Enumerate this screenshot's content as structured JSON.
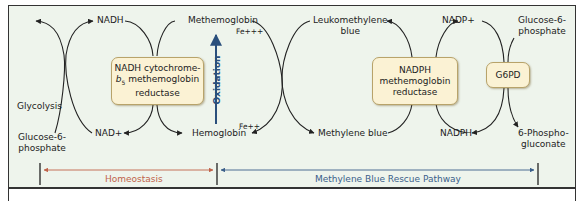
{
  "colors": {
    "background": "#eef4ec",
    "enzyme_fill": "#fbf2d4",
    "enzyme_border": "#b8a36a",
    "curve": "#222222",
    "oxidation": "#2a4f7c",
    "homeostasis": "#c0634a",
    "rescue": "#3b5f8a"
  },
  "left_cycle": {
    "top_left": "Glycolysis",
    "bottom_left": "Glucose-6-\nphosphate",
    "top_cofactor": "NADH",
    "bottom_cofactor": "NAD+"
  },
  "enzymes": {
    "cytb5": {
      "line1": "NADH cytochrome-",
      "line2_italic": "b",
      "line2_sub": "5",
      "line2_rest": " methemoglobin",
      "line3": "reductase"
    },
    "nadph": {
      "line1": "NADPH",
      "line2": "methemoglobin",
      "line3": "reductase"
    },
    "g6pd": {
      "label": "G6PD"
    }
  },
  "center": {
    "methemoglobin": "Methemoglobin",
    "fe3": "Fe+++",
    "hemoglobin": "Hemoglobin",
    "fe2": "Fe++",
    "oxidation": "Oxidation"
  },
  "right_cycle": {
    "leukomethylene": "Leukomethylene\nblue",
    "methylene_blue": "Methylene blue",
    "nadp_plus": "NADP+",
    "nadph": "NADPH",
    "g6p": "Glucose-6-\nphosphate",
    "pg": "6-Phospho-\ngluconate"
  },
  "pathways": {
    "homeostasis": "Homeostasis",
    "rescue": "Methylene Blue Rescue Pathway"
  }
}
